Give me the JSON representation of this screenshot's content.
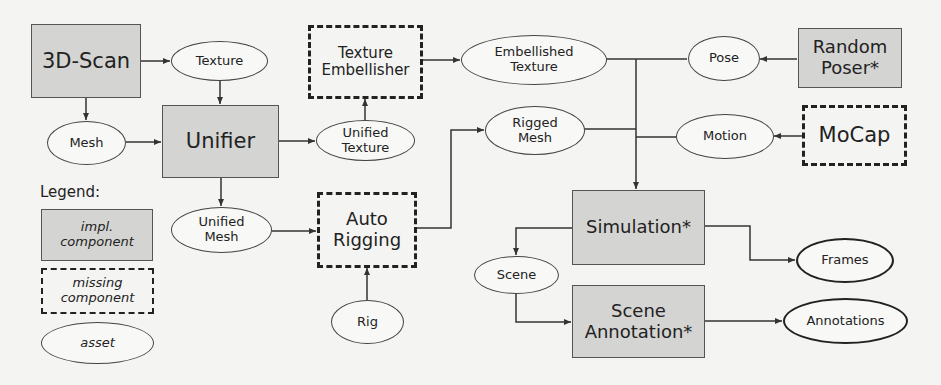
{
  "diagram": {
    "colors": {
      "background": "#f4f4f2",
      "impl_fill": "#d4d4d2",
      "stroke": "#333333"
    },
    "nodes": {
      "scan3d": {
        "label": "3D-Scan",
        "type": "impl"
      },
      "texture": {
        "label": "Texture",
        "type": "asset"
      },
      "mesh": {
        "label": "Mesh",
        "type": "asset"
      },
      "unifier": {
        "label": "Unifier",
        "type": "impl"
      },
      "texture_embellisher": {
        "label_line1": "Texture",
        "label_line2": "Embellisher",
        "type": "missing"
      },
      "unified_texture": {
        "label_line1": "Unified",
        "label_line2": "Texture",
        "type": "asset"
      },
      "embellished_texture": {
        "label_line1": "Embellished",
        "label_line2": "Texture",
        "type": "asset"
      },
      "rigged_mesh": {
        "label_line1": "Rigged",
        "label_line2": "Mesh",
        "type": "asset"
      },
      "unified_mesh": {
        "label_line1": "Unified",
        "label_line2": "Mesh",
        "type": "asset"
      },
      "auto_rigging": {
        "label_line1": "Auto",
        "label_line2": "Rigging",
        "type": "missing"
      },
      "rig": {
        "label": "Rig",
        "type": "asset"
      },
      "pose": {
        "label": "Pose",
        "type": "asset"
      },
      "random_poser": {
        "label_line1": "Random",
        "label_line2": "Poser*",
        "type": "impl"
      },
      "motion": {
        "label": "Motion",
        "type": "asset"
      },
      "mocap": {
        "label": "MoCap",
        "type": "missing"
      },
      "simulation": {
        "label": "Simulation*",
        "type": "impl"
      },
      "scene": {
        "label": "Scene",
        "type": "asset"
      },
      "scene_annotation": {
        "label_line1": "Scene",
        "label_line2": "Annotation*",
        "type": "impl"
      },
      "frames": {
        "label": "Frames",
        "type": "asset"
      },
      "annotations": {
        "label": "Annotations",
        "type": "asset"
      }
    },
    "legend": {
      "title": "Legend:",
      "impl_line1": "impl.",
      "impl_line2": "component",
      "missing_line1": "missing",
      "missing_line2": "component",
      "asset": "asset"
    },
    "edges": [
      {
        "from": "3D-Scan",
        "to": "Texture"
      },
      {
        "from": "3D-Scan",
        "to": "Mesh"
      },
      {
        "from": "Texture",
        "to": "Unifier"
      },
      {
        "from": "Mesh",
        "to": "Unifier"
      },
      {
        "from": "Unifier",
        "to": "Unified Texture"
      },
      {
        "from": "Unifier",
        "to": "Unified Mesh"
      },
      {
        "from": "Unified Texture",
        "to": "Texture Embellisher"
      },
      {
        "from": "Texture Embellisher",
        "to": "Embellished Texture"
      },
      {
        "from": "Unified Mesh",
        "to": "Auto Rigging"
      },
      {
        "from": "Rig",
        "to": "Auto Rigging"
      },
      {
        "from": "Auto Rigging",
        "to": "Rigged Mesh"
      },
      {
        "from": "Random Poser*",
        "to": "Pose"
      },
      {
        "from": "MoCap",
        "to": "Motion"
      },
      {
        "from": "Embellished Texture",
        "to": "Simulation*"
      },
      {
        "from": "Rigged Mesh",
        "to": "Simulation*"
      },
      {
        "from": "Pose",
        "to": "Simulation*"
      },
      {
        "from": "Motion",
        "to": "Simulation*"
      },
      {
        "from": "Simulation*",
        "to": "Scene"
      },
      {
        "from": "Simulation*",
        "to": "Frames"
      },
      {
        "from": "Scene",
        "to": "Scene Annotation*"
      },
      {
        "from": "Scene Annotation*",
        "to": "Annotations"
      }
    ]
  }
}
